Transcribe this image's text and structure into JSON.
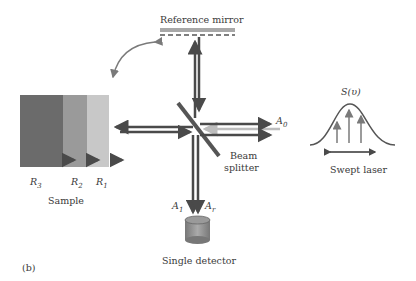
{
  "figure": {
    "panel_label": "(b)",
    "reference_mirror_label": "Reference mirror",
    "beam_splitter_label_line1": "Beam",
    "beam_splitter_label_line2": "splitter",
    "sample_label": "Sample",
    "swept_laser_label": "Swept laser",
    "spectrum_label": "S(υ)",
    "detector_label": "Single detector",
    "layers": [
      {
        "label": "R",
        "sub": "3",
        "color": "#6b6b6b"
      },
      {
        "label": "R",
        "sub": "2",
        "color": "#9a9a9a"
      },
      {
        "label": "R",
        "sub": "1",
        "color": "#c8c8c8"
      }
    ],
    "field_labels": {
      "a0": {
        "label": "A",
        "sub": "0"
      },
      "a1": {
        "label": "A",
        "sub": "1"
      },
      "ar": {
        "label": "A",
        "sub": "r"
      }
    },
    "colors": {
      "beam_dark": "#4a4a4a",
      "beam_light": "#bdbdbd",
      "mirror": "#a8a8a8",
      "curve": "#555555",
      "arrow_gray": "#7a7a7a"
    }
  }
}
